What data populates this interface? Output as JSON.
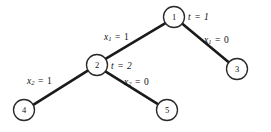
{
  "figure": {
    "name": "binary-decision-tree",
    "background_color": "#ffffff",
    "edge_color": "#1a1a1a",
    "node_stroke_color": "#2a2a2a",
    "node_fill_color": "#ffffff"
  },
  "nodes": [
    {
      "id": "1",
      "label": "1",
      "cx": 174,
      "cy": 17,
      "r": 10.5,
      "annotation": "t = 1",
      "annotation_var": "t",
      "annotation_value": "1"
    },
    {
      "id": "2",
      "label": "2",
      "cx": 97,
      "cy": 65,
      "r": 10.5,
      "annotation": "t = 2",
      "annotation_var": "t",
      "annotation_value": "2"
    },
    {
      "id": "3",
      "label": "3",
      "cx": 237,
      "cy": 69,
      "r": 10.5,
      "annotation": "",
      "annotation_var": "",
      "annotation_value": ""
    },
    {
      "id": "4",
      "label": "4",
      "cx": 24,
      "cy": 110,
      "r": 10.5,
      "annotation": "",
      "annotation_var": "",
      "annotation_value": ""
    },
    {
      "id": "5",
      "label": "5",
      "cx": 167,
      "cy": 110,
      "r": 10.5,
      "annotation": "",
      "annotation_var": "",
      "annotation_value": ""
    }
  ],
  "edges": [
    {
      "from": "1",
      "to": "2",
      "label_var": "x",
      "label_sub": "1",
      "label_value": "1",
      "label_text": "x1 = 1",
      "label_x": 104,
      "label_y": 37
    },
    {
      "from": "1",
      "to": "3",
      "label_var": "x",
      "label_sub": "1",
      "label_value": "0",
      "label_text": "x1 = 0",
      "label_x": 204,
      "label_y": 40
    },
    {
      "from": "2",
      "to": "4",
      "label_var": "x",
      "label_sub": "2",
      "label_value": "1",
      "label_text": "x2 = 1",
      "label_x": 27,
      "label_y": 81
    },
    {
      "from": "2",
      "to": "5",
      "label_var": "x",
      "label_sub": "2",
      "label_value": "0",
      "label_text": "x2 = 0",
      "label_x": 124,
      "label_y": 82
    }
  ],
  "node_annotations": [
    {
      "for_node": "1",
      "var": "t",
      "op": "=",
      "value": "1",
      "x": 188,
      "y": 17
    },
    {
      "for_node": "2",
      "var": "t",
      "op": "=",
      "value": "2",
      "x": 111,
      "y": 66
    }
  ]
}
